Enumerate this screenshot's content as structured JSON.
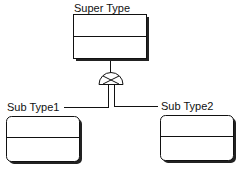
{
  "diagram": {
    "type": "er-supertype-subtype",
    "supertype": {
      "label": "Super Type"
    },
    "subtypes": [
      {
        "label": "Sub Type1"
      },
      {
        "label": "Sub Type2"
      }
    ],
    "connector": {
      "symbol": "exclusive-subtype-crossed-semicircle"
    }
  },
  "colors": {
    "line": "#111111",
    "shadow": "#222222",
    "background": "#ffffff"
  }
}
